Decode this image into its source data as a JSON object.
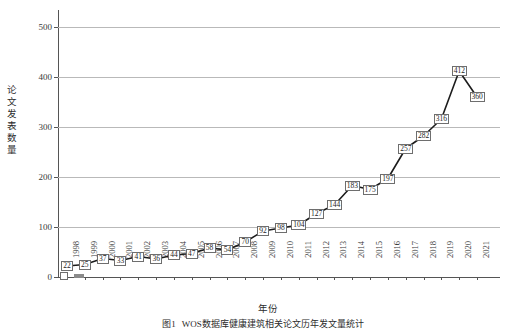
{
  "chart_data": {
    "type": "line",
    "title": "",
    "xlabel": "年份",
    "ylabel": "论文发表数量",
    "categories": [
      "1998",
      "1999",
      "2000",
      "2001",
      "2002",
      "2003",
      "2004",
      "2005",
      "2006",
      "2007",
      "2008",
      "2009",
      "2010",
      "2011",
      "2012",
      "2013",
      "2014",
      "2015",
      "2016",
      "2017",
      "2018",
      "2019",
      "2020",
      "2021"
    ],
    "values": [
      22,
      25,
      37,
      33,
      41,
      36,
      44,
      47,
      58,
      54,
      70,
      92,
      98,
      104,
      127,
      144,
      183,
      175,
      197,
      257,
      282,
      316,
      412,
      360
    ],
    "series": [
      {
        "name": "论文发表数量",
        "values": [
          22,
          25,
          37,
          33,
          41,
          36,
          44,
          47,
          58,
          54,
          70,
          92,
          98,
          104,
          127,
          144,
          183,
          175,
          197,
          257,
          282,
          316,
          412,
          360
        ]
      }
    ],
    "ylim": [
      0,
      540
    ],
    "yticks": [
      0,
      100,
      200,
      300,
      400,
      500
    ],
    "ytick_labels": [
      "0",
      "100",
      "200",
      "300",
      "400",
      "500"
    ],
    "grid": true,
    "grid_axis": "y",
    "legend": false,
    "data_labels": true,
    "line_color": "#1c1c1c",
    "grid_color": "#b9b9b9",
    "axis_color": "#555555"
  },
  "caption": {
    "number": "图1",
    "text": "WOS数据库健康建筑相关论文历年发文量统计"
  },
  "axes": {
    "y_title": "论文发表数量",
    "x_title": "年份"
  }
}
